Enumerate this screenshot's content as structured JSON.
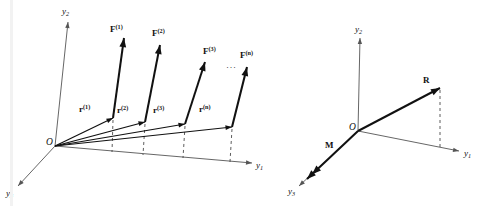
{
  "figure": {
    "background_color": "#ffffff",
    "ink_color": "#111111",
    "axis_color": "#555555",
    "width": 488,
    "height": 206,
    "artifact_x": 10
  },
  "left_diagram": {
    "name": "system-of-forces",
    "origin": {
      "label": "O",
      "x": 55,
      "y": 146
    },
    "axes": [
      {
        "name": "y2",
        "label": "y",
        "subscript": "2",
        "x1": 55,
        "y1": 146,
        "x2": 68,
        "y2": 22,
        "label_x": 62,
        "label_y": 14
      },
      {
        "name": "y1",
        "label": "y",
        "subscript": "1",
        "x1": 55,
        "y1": 146,
        "x2": 252,
        "y2": 163,
        "label_x": 256,
        "label_y": 168
      },
      {
        "name": "y3",
        "label": "y",
        "subscript": "3",
        "x1": 55,
        "y1": 146,
        "x2": 18,
        "y2": 186,
        "label_x": 6,
        "label_y": 196
      }
    ],
    "position_vectors": [
      {
        "name": "r1",
        "label": "r",
        "superscript": "(1)",
        "x1": 55,
        "y1": 146,
        "x2": 113,
        "y2": 118,
        "label_x": 79,
        "label_y": 112
      },
      {
        "name": "r2",
        "label": "r",
        "superscript": "(2)",
        "x1": 55,
        "y1": 146,
        "x2": 145,
        "y2": 122,
        "label_x": 117,
        "label_y": 113
      },
      {
        "name": "r3",
        "label": "r",
        "superscript": "(3)",
        "x1": 55,
        "y1": 146,
        "x2": 185,
        "y2": 124,
        "label_x": 153,
        "label_y": 113
      },
      {
        "name": "rn",
        "label": "r",
        "superscript": "(n)",
        "x1": 55,
        "y1": 146,
        "x2": 232,
        "y2": 127,
        "label_x": 199,
        "label_y": 112
      }
    ],
    "force_vectors": [
      {
        "name": "F1",
        "label": "F",
        "superscript": "(1)",
        "x1": 113,
        "y1": 118,
        "x2": 124,
        "y2": 38,
        "label_x": 110,
        "label_y": 32
      },
      {
        "name": "F2",
        "label": "F",
        "superscript": "(2)",
        "x1": 145,
        "y1": 122,
        "x2": 160,
        "y2": 45,
        "label_x": 152,
        "label_y": 36
      },
      {
        "name": "F3",
        "label": "F",
        "superscript": "(3)",
        "x1": 185,
        "y1": 124,
        "x2": 205,
        "y2": 62,
        "label_x": 203,
        "label_y": 54
      },
      {
        "name": "Fn",
        "label": "F",
        "superscript": "(n)",
        "x1": 232,
        "y1": 127,
        "x2": 247,
        "y2": 67,
        "label_x": 240,
        "label_y": 58
      }
    ],
    "ellipsis": {
      "text": "···",
      "x": 226,
      "y": 70
    },
    "projection_lines": [
      {
        "name": "drop-1",
        "x1": 113,
        "y1": 120,
        "x2": 112,
        "y2": 152
      },
      {
        "name": "drop-2",
        "x1": 145,
        "y1": 124,
        "x2": 143,
        "y2": 155
      },
      {
        "name": "drop-3",
        "x1": 185,
        "y1": 126,
        "x2": 183,
        "y2": 158
      },
      {
        "name": "drop-n",
        "x1": 232,
        "y1": 129,
        "x2": 230,
        "y2": 162
      }
    ]
  },
  "right_diagram": {
    "name": "resultant-and-moment",
    "origin": {
      "label": "O",
      "x": 358,
      "y": 131
    },
    "axes": [
      {
        "name": "y2",
        "label": "y",
        "subscript": "2",
        "x1": 358,
        "y1": 131,
        "x2": 360,
        "y2": 38,
        "label_x": 355,
        "label_y": 32
      },
      {
        "name": "y1",
        "label": "y",
        "subscript": "1",
        "x1": 358,
        "y1": 131,
        "x2": 459,
        "y2": 151,
        "label_x": 464,
        "label_y": 156
      },
      {
        "name": "y3",
        "label": "y",
        "subscript": "3",
        "x1": 358,
        "y1": 131,
        "x2": 299,
        "y2": 186,
        "label_x": 288,
        "label_y": 194
      }
    ],
    "vectors": [
      {
        "name": "R",
        "label": "R",
        "x1": 358,
        "y1": 131,
        "x2": 440,
        "y2": 88,
        "label_x": 423,
        "label_y": 83,
        "double_head": false
      },
      {
        "name": "M",
        "label": "M",
        "x1": 358,
        "y1": 131,
        "x2": 307,
        "y2": 179,
        "label_x": 325,
        "label_y": 148,
        "double_head": true
      }
    ],
    "projection_lines": [
      {
        "name": "drop-R",
        "x1": 440,
        "y1": 90,
        "x2": 440,
        "y2": 147
      }
    ]
  }
}
